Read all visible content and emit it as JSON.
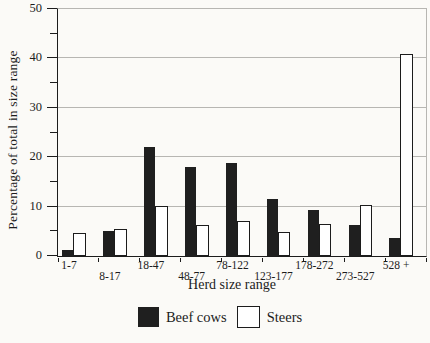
{
  "chart_data": {
    "type": "bar",
    "title": "",
    "xlabel": "Herd size range",
    "ylabel": "Percentage of total in size range",
    "categories": [
      "1-7",
      "8-17",
      "18-47",
      "48-77",
      "78-122",
      "123-177",
      "178-272",
      "273-527",
      "528 +"
    ],
    "series": [
      {
        "name": "Beef cows",
        "color": "#1f1f1f",
        "values": [
          1.3,
          5.1,
          22.0,
          18.0,
          18.8,
          11.5,
          9.3,
          6.3,
          3.7
        ]
      },
      {
        "name": "Steers",
        "color": "#ffffff",
        "values": [
          4.7,
          5.5,
          10.1,
          6.3,
          7.1,
          4.9,
          6.4,
          10.3,
          40.8
        ]
      }
    ],
    "ylim": [
      0,
      50
    ],
    "ytick_major": [
      0,
      10,
      20,
      30,
      40,
      50
    ],
    "ytick_minor": [
      5,
      15,
      25,
      35,
      45
    ],
    "grid": "horizontal-major",
    "legend_position": "bottom-center"
  },
  "colors": {
    "bar_fill_dark": "#1f1f1f",
    "bar_fill_light": "#ffffff",
    "bar_border": "#1c1c1c",
    "gridline": "#b7b6b2",
    "axis": "#1c1c1c",
    "text": "#1c1c1c",
    "background": "#fbfaf7"
  }
}
